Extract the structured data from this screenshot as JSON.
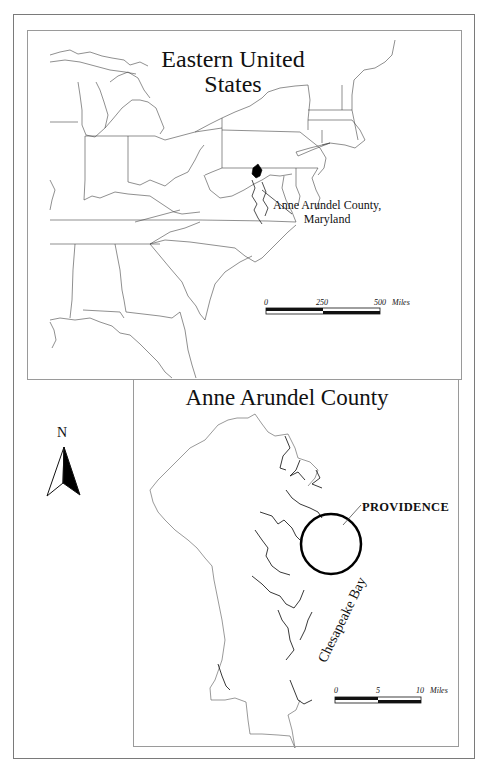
{
  "figure": {
    "top_panel": {
      "title_line1": "Eastern United",
      "title_line2": "States",
      "callout_line1": "Anne Arundel County,",
      "callout_line2": "Maryland",
      "scale_bar": {
        "ticks": [
          "0",
          "250",
          "500"
        ],
        "unit": "Miles"
      }
    },
    "bottom_panel": {
      "title": "Anne Arundel County",
      "site_label": "PROVIDENCE",
      "water_label": "Chesapeake Bay",
      "north_label": "N",
      "scale_bar": {
        "ticks": [
          "0",
          "5",
          "10"
        ],
        "unit": "Miles"
      }
    },
    "colors": {
      "line": "#333333",
      "fill": "#000000",
      "frame": "#9a9a9a",
      "background": "#ffffff"
    }
  }
}
